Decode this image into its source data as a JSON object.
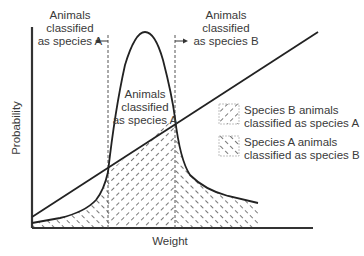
{
  "diagram": {
    "axes": {
      "ylabel": "Probability",
      "xlabel": "Weight"
    },
    "annotations": {
      "left_region": [
        "Animals",
        "classified",
        "as species A"
      ],
      "right_region": [
        "Animals",
        "classified",
        "as species B"
      ],
      "center_region": [
        "Animals",
        "classified",
        "as species A"
      ]
    },
    "legend": [
      {
        "pattern": "forward-hatch",
        "line1": "Species B animals",
        "line2": "classified as species A"
      },
      {
        "pattern": "back-hatch",
        "line1": "Species A animals",
        "line2": "classified as species B"
      }
    ],
    "curves": [
      {
        "name": "species-A-bell-curve",
        "type": "bell"
      },
      {
        "name": "species-B-linear",
        "type": "straight-line"
      }
    ]
  }
}
